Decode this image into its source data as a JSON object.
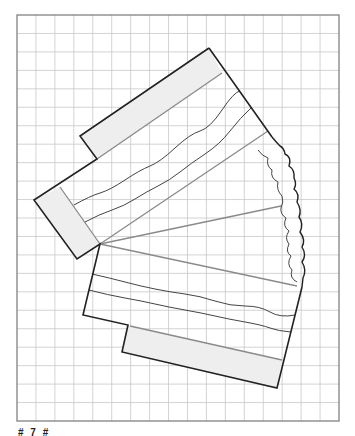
{
  "figure": {
    "type": "geometric construction on grid paper",
    "grid": {
      "visible": true,
      "columns": 17,
      "rows": 22
    },
    "colors": {
      "grid_line": "#c8c8c8",
      "frame": "#777777",
      "outline": "#222222",
      "band_fill": "#eeeeee",
      "radial_line": "#8a8a8a",
      "wavy_line": "#444444"
    },
    "parts": [
      {
        "name": "upper-shaded-band",
        "role": "shaded end band"
      },
      {
        "name": "left-shaded-band",
        "role": "shaded end band"
      },
      {
        "name": "lower-shaded-band",
        "role": "shaded end band"
      },
      {
        "name": "radial-lines",
        "role": "lines from apex",
        "count": 4
      },
      {
        "name": "wavy-lines",
        "role": "fold lines",
        "count": 4
      },
      {
        "name": "cloud-edge",
        "role": "irregular torn edge"
      }
    ]
  },
  "caption": {
    "text": "# 7 #"
  }
}
